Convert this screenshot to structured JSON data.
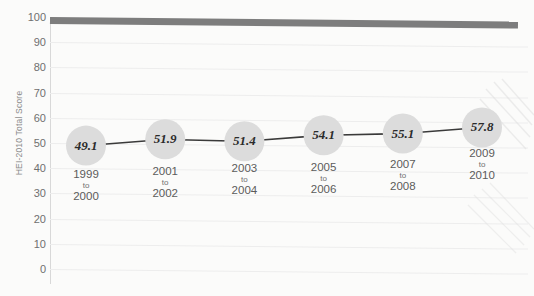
{
  "chart_data": {
    "type": "line",
    "title": "",
    "xlabel": "",
    "ylabel": "HEI-2010 Total Score",
    "ylim": [
      0,
      100
    ],
    "yticks": [
      100,
      90,
      80,
      70,
      60,
      50,
      40,
      30,
      20,
      10,
      0
    ],
    "grid": true,
    "legend": "none",
    "categories": [
      "1999 to 2000",
      "2001 to 2002",
      "2003 to 2004",
      "2005 to 2006",
      "2007 to 2008",
      "2009 to 2010"
    ],
    "category_parts": [
      {
        "start": "1999",
        "to": "to",
        "end": "2000"
      },
      {
        "start": "2001",
        "to": "to",
        "end": "2002"
      },
      {
        "start": "2003",
        "to": "to",
        "end": "2004"
      },
      {
        "start": "2005",
        "to": "to",
        "end": "2006"
      },
      {
        "start": "2007",
        "to": "to",
        "end": "2008"
      },
      {
        "start": "2009",
        "to": "to",
        "end": "2010"
      }
    ],
    "values": [
      49.1,
      51.9,
      51.4,
      54.1,
      55.1,
      57.8
    ],
    "point_labels": [
      "49.1",
      "51.9",
      "51.4",
      "54.1",
      "55.1",
      "57.8"
    ],
    "reference_line": {
      "label": "100",
      "value": 100,
      "color": "#7d7d7d",
      "style": "thick-bar"
    },
    "colors": {
      "marker_fill": "#dcdcdc",
      "line": "#3a3a3a",
      "gridline": "#ededed",
      "axis": "#d8d8d8",
      "tick_text": "#6f6f6f",
      "background": "#fbfbfa"
    }
  }
}
